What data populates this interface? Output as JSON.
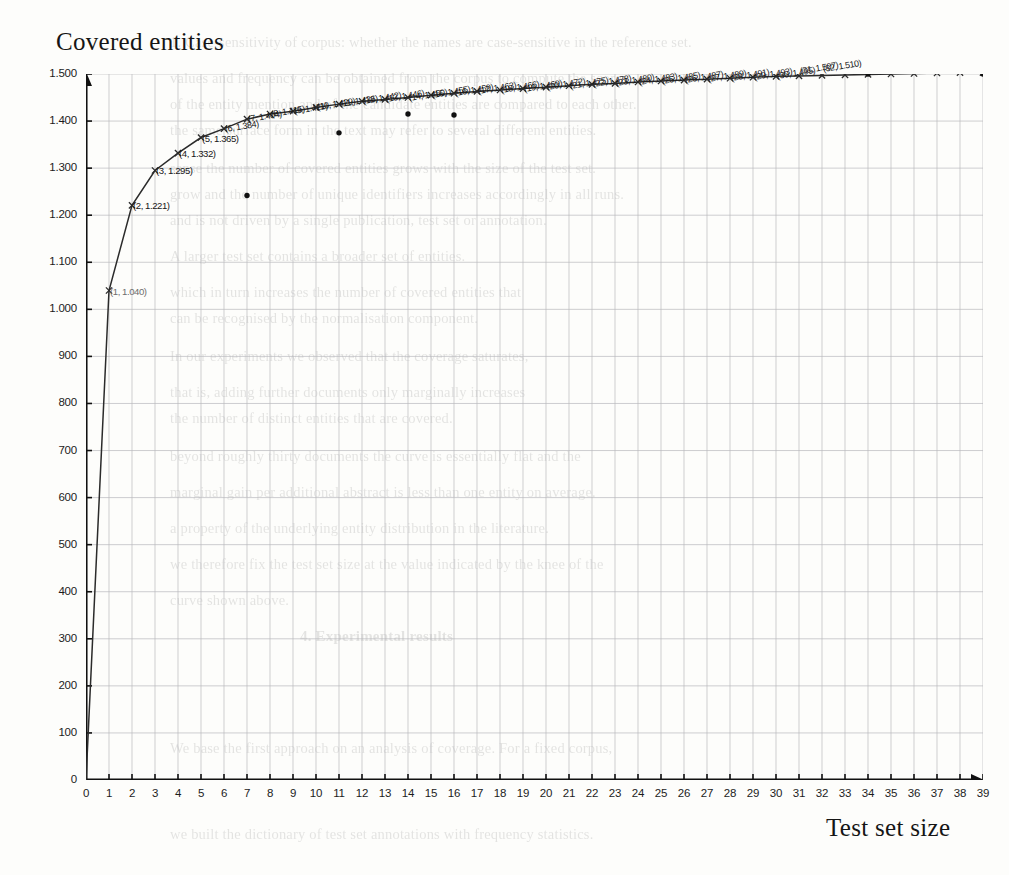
{
  "document": {
    "kind": "scanned-page-figure",
    "ghost_text": [
      "1. Case-sensitivity of corpus: whether the names are case-sensitive in the reference set.",
      "values and frequency can be obtained from the corpus to compute the scores.",
      "of the entity mention and of the candidate entities are compared to each other.",
      "the same surface form in the text may refer to several different entities.",
      "sense the number of covered entities grows with the size of the test set.",
      "grow and the number of unique identifiers increases accordingly in all runs.",
      "and is not driven by a single publication, test set or annotation.",
      "A larger test set contains a broader set of entities.",
      "which in turn increases the number of covered entities that",
      "can be recognised by the normalisation component.",
      "In our experiments we observed that the coverage saturates,",
      "that is, adding further documents only marginally increases",
      "the number of distinct entities that are covered.",
      "beyond roughly thirty documents the curve is essentially flat and the",
      "marginal gain per additional abstract is less than one entity on average.",
      "a property of the underlying entity distribution in the literature.",
      "we therefore fix the test set size at the value indicated by the knee of the",
      "curve shown above.",
      "4. Experimental results",
      "We base the first approach on an analysis of coverage. For a fixed corpus,",
      "we built the dictionary of test set annotations with frequency statistics."
    ]
  },
  "chart_data": {
    "type": "line",
    "title": "Covered entities",
    "xlabel": "Test set size",
    "ylabel": "Covered entities",
    "xlim": [
      0,
      39
    ],
    "ylim": [
      0,
      1500
    ],
    "xticks": [
      0,
      1,
      2,
      3,
      4,
      5,
      6,
      7,
      8,
      9,
      10,
      11,
      12,
      13,
      14,
      15,
      16,
      17,
      18,
      19,
      20,
      21,
      22,
      23,
      24,
      25,
      26,
      27,
      28,
      29,
      30,
      31,
      32,
      33,
      34,
      35,
      36,
      37,
      38,
      39
    ],
    "xtick_labels": [
      "0",
      "1",
      "2",
      "3",
      "4",
      "5",
      "6",
      "7",
      "8",
      "9",
      "10",
      "11",
      "12",
      "13",
      "14",
      "15",
      "16",
      "17",
      "18",
      "19",
      "20",
      "21",
      "22",
      "23",
      "24",
      "25",
      "26",
      "27",
      "28",
      "29",
      "30",
      "31",
      "32",
      "33",
      "34",
      "35",
      "36",
      "37",
      "38",
      "39"
    ],
    "yticks": [
      0,
      100,
      200,
      300,
      400,
      500,
      600,
      700,
      800,
      900,
      1000,
      1100,
      1200,
      1300,
      1400,
      1500
    ],
    "ytick_labels": [
      "0",
      "100",
      "200",
      "300",
      "400",
      "500",
      "600",
      "700",
      "800",
      "900",
      "1.000",
      "1.100",
      "1.200",
      "1.300",
      "1.400",
      "1.500"
    ],
    "grid": true,
    "legend": false,
    "series": [
      {
        "name": "covered entities",
        "marker": "cross",
        "line_color": "#2b2b2b",
        "x": [
          0,
          1,
          2,
          3,
          4,
          5,
          6,
          7,
          8,
          9,
          10,
          11,
          12,
          13,
          14,
          15,
          16,
          17,
          18,
          19,
          20,
          21,
          22,
          23,
          24,
          25,
          26,
          27,
          28,
          29,
          30,
          31,
          32,
          33,
          34,
          35,
          36,
          37,
          38,
          39
        ],
        "values": [
          0,
          1040,
          1221,
          1295,
          1332,
          1365,
          1384,
          1404,
          1415,
          1421,
          1429,
          1436,
          1442,
          1446,
          1450,
          1455,
          1459,
          1463,
          1466,
          1469,
          1472,
          1475,
          1478,
          1480,
          1483,
          1485,
          1487,
          1489,
          1491,
          1493,
          1495,
          1496,
          1497,
          1498,
          1499,
          1500,
          1501,
          1502,
          1503,
          1503
        ],
        "point_labels": [
          {
            "x": 1,
            "y": 1040,
            "text": "(1, 1.040)"
          },
          {
            "x": 2,
            "y": 1221,
            "text": "(2, 1.221)"
          },
          {
            "x": 3,
            "y": 1295,
            "text": "(3, 1.295)"
          },
          {
            "x": 4,
            "y": 1332,
            "text": "(4, 1.332)"
          },
          {
            "x": 5,
            "y": 1365,
            "text": "(5, 1.365)"
          },
          {
            "x": 6,
            "y": 1384,
            "text": "(6, 1.384)"
          },
          {
            "x": 7,
            "y": 1404,
            "text": "(7, 1.404)"
          },
          {
            "x": 8,
            "y": 1415,
            "text": "(8, 1.415)"
          },
          {
            "x": 9,
            "y": 1421,
            "text": "(9, 1.421)"
          },
          {
            "x": 10,
            "y": 1429,
            "text": "(10, 1.429)"
          },
          {
            "x": 11,
            "y": 1436,
            "text": "(11, 1.436)"
          },
          {
            "x": 12,
            "y": 1442,
            "text": "(12, 1.442)"
          },
          {
            "x": 13,
            "y": 1446,
            "text": "(13, 1.446)"
          },
          {
            "x": 14,
            "y": 1450,
            "text": "(14, 1.450)"
          },
          {
            "x": 15,
            "y": 1455,
            "text": "(15, 1.455)"
          },
          {
            "x": 16,
            "y": 1459,
            "text": "(16, 1.459)"
          },
          {
            "x": 17,
            "y": 1463,
            "text": "(17, 1.463)"
          },
          {
            "x": 18,
            "y": 1466,
            "text": "(18, 1.466)"
          },
          {
            "x": 19,
            "y": 1469,
            "text": "(19, 1.469)"
          },
          {
            "x": 20,
            "y": 1472,
            "text": "(20, 1.472)"
          },
          {
            "x": 21,
            "y": 1475,
            "text": "(21, 1.475)"
          },
          {
            "x": 22,
            "y": 1478,
            "text": "(22, 1.478)"
          },
          {
            "x": 23,
            "y": 1480,
            "text": "(23, 1.480)"
          },
          {
            "x": 24,
            "y": 1483,
            "text": "(24, 1.483)"
          },
          {
            "x": 25,
            "y": 1485,
            "text": "(25, 1.485)"
          },
          {
            "x": 26,
            "y": 1487,
            "text": "(26, 1.487)"
          },
          {
            "x": 27,
            "y": 1489,
            "text": "(27, 1.489)"
          },
          {
            "x": 28,
            "y": 1491,
            "text": "(28, 1.491)"
          },
          {
            "x": 29,
            "y": 1493,
            "text": "(29, 1.493)"
          },
          {
            "x": 30,
            "y": 1495,
            "text": "(30, 1.495)"
          },
          {
            "x": 31,
            "y": 1507,
            "text": "(31, 1.507)"
          },
          {
            "x": 32,
            "y": 1510,
            "text": "(32, 1.510)"
          }
        ]
      },
      {
        "name": "outliers",
        "marker": "dot",
        "line_color": "none",
        "x": [
          7,
          11,
          14,
          16,
          34,
          39
        ],
        "values": [
          1242,
          1375,
          1415,
          1413,
          1500,
          1500
        ]
      }
    ]
  }
}
